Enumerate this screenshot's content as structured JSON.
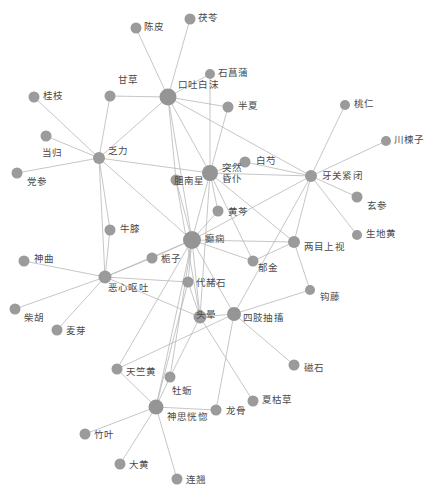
{
  "figure": {
    "type": "network-graph",
    "title": "",
    "node_color": "#9b9b9b",
    "edge_color": "#b8b8b8",
    "label_color": "#4a4a4a",
    "background": "#ffffff",
    "width": 434,
    "height": 499
  },
  "chart_data": {
    "type": "network",
    "title": "",
    "nodes": [
      {
        "id": "chenpi",
        "label": "陈皮",
        "x": 136,
        "y": 28,
        "r": 5.5,
        "lx": 144,
        "ly": 22
      },
      {
        "id": "fuling",
        "label": "茯苓",
        "x": 190,
        "y": 19,
        "r": 5.5,
        "lx": 198,
        "ly": 13
      },
      {
        "id": "shichangpu",
        "label": "石菖蒲",
        "x": 210,
        "y": 74,
        "r": 5.0,
        "lx": 218,
        "ly": 68
      },
      {
        "id": "gancao",
        "label": "甘草",
        "x": 110,
        "y": 96,
        "r": 5.5,
        "lx": 118,
        "ly": 75
      },
      {
        "id": "koutubaimo",
        "label": "口吐白沫",
        "x": 168,
        "y": 97,
        "r": 8.5,
        "lx": 178,
        "ly": 80
      },
      {
        "id": "banxia",
        "label": "半夏",
        "x": 228,
        "y": 107,
        "r": 5.5,
        "lx": 238,
        "ly": 101
      },
      {
        "id": "guizhi",
        "label": "桂枝",
        "x": 34,
        "y": 97,
        "r": 5.5,
        "lx": 43,
        "ly": 91
      },
      {
        "id": "taoren",
        "label": "桃仁",
        "x": 345,
        "y": 105,
        "r": 5.0,
        "lx": 354,
        "ly": 99
      },
      {
        "id": "danggui",
        "label": "当归",
        "x": 46,
        "y": 136,
        "r": 5.5,
        "lx": 42,
        "ly": 148
      },
      {
        "id": "fali",
        "label": "乏力",
        "x": 99,
        "y": 158,
        "r": 6.0,
        "lx": 108,
        "ly": 146
      },
      {
        "id": "chuanlianzi",
        "label": "川楝子",
        "x": 386,
        "y": 141,
        "r": 5.0,
        "lx": 394,
        "ly": 135
      },
      {
        "id": "baishao",
        "label": "白芍",
        "x": 245,
        "y": 162,
        "r": 5.5,
        "lx": 256,
        "ly": 156
      },
      {
        "id": "dangshen",
        "label": "党参",
        "x": 17,
        "y": 173,
        "r": 5.5,
        "lx": 27,
        "ly": 177
      },
      {
        "id": "yaguanjinbi",
        "label": "牙关紧闭",
        "x": 311,
        "y": 176,
        "r": 6.0,
        "lx": 322,
        "ly": 171
      },
      {
        "id": "dannanxing",
        "label": "胆南星",
        "x": 176,
        "y": 180,
        "r": 5.5,
        "lx": 174,
        "ly": 176
      },
      {
        "id": "turanhunpu",
        "label": "突然昏仆",
        "x": 210,
        "y": 173,
        "r": 8.0,
        "lx": 222,
        "ly": 163
      },
      {
        "id": "xuanshen",
        "label": "玄参",
        "x": 357,
        "y": 197,
        "r": 5.5,
        "lx": 367,
        "ly": 201
      },
      {
        "id": "niuxi",
        "label": "牛膝",
        "x": 110,
        "y": 230,
        "r": 5.5,
        "lx": 120,
        "ly": 224
      },
      {
        "id": "huangqin",
        "label": "黄芩",
        "x": 218,
        "y": 211,
        "r": 5.5,
        "lx": 228,
        "ly": 207
      },
      {
        "id": "shengdihuang",
        "label": "生地黄",
        "x": 357,
        "y": 235,
        "r": 5.0,
        "lx": 366,
        "ly": 229
      },
      {
        "id": "dianxian",
        "label": "癫痫",
        "x": 192,
        "y": 240,
        "r": 9.0,
        "lx": 205,
        "ly": 234
      },
      {
        "id": "liangmushang",
        "label": "两目上视",
        "x": 294,
        "y": 242,
        "r": 6.0,
        "lx": 304,
        "ly": 242
      },
      {
        "id": "zhizi",
        "label": "栀子",
        "x": 152,
        "y": 258,
        "r": 5.5,
        "lx": 161,
        "ly": 254
      },
      {
        "id": "shenqu",
        "label": "神曲",
        "x": 24,
        "y": 261,
        "r": 5.5,
        "lx": 34,
        "ly": 254
      },
      {
        "id": "yujin",
        "label": "郁金",
        "x": 253,
        "y": 261,
        "r": 5.5,
        "lx": 258,
        "ly": 263
      },
      {
        "id": "exinoutu",
        "label": "恶心呕吐",
        "x": 105,
        "y": 277,
        "r": 6.5,
        "lx": 108,
        "ly": 283
      },
      {
        "id": "daizheshi",
        "label": "代赭石",
        "x": 188,
        "y": 282,
        "r": 5.5,
        "lx": 196,
        "ly": 278
      },
      {
        "id": "gouteng",
        "label": "钩藤",
        "x": 310,
        "y": 290,
        "r": 5.0,
        "lx": 320,
        "ly": 292
      },
      {
        "id": "chaihu",
        "label": "柴胡",
        "x": 15,
        "y": 309,
        "r": 5.5,
        "lx": 24,
        "ly": 313
      },
      {
        "id": "touyun",
        "label": "头晕",
        "x": 200,
        "y": 317,
        "r": 6.5,
        "lx": 196,
        "ly": 310
      },
      {
        "id": "sizhichouchu",
        "label": "四肢抽搐",
        "x": 234,
        "y": 314,
        "r": 7.0,
        "lx": 243,
        "ly": 313
      },
      {
        "id": "maiya",
        "label": "麦芽",
        "x": 57,
        "y": 330,
        "r": 5.5,
        "lx": 66,
        "ly": 326
      },
      {
        "id": "cishi",
        "label": "磁石",
        "x": 294,
        "y": 365,
        "r": 5.5,
        "lx": 304,
        "ly": 363
      },
      {
        "id": "tianzhuhuang",
        "label": "天竺黄",
        "x": 117,
        "y": 369,
        "r": 5.5,
        "lx": 126,
        "ly": 367
      },
      {
        "id": "muli",
        "label": "牡蛎",
        "x": 170,
        "y": 377,
        "r": 5.5,
        "lx": 172,
        "ly": 386
      },
      {
        "id": "xiakucao",
        "label": "夏枯草",
        "x": 253,
        "y": 401,
        "r": 5.5,
        "lx": 262,
        "ly": 395
      },
      {
        "id": "shensihuang",
        "label": "神思恍惚",
        "x": 156,
        "y": 407,
        "r": 7.5,
        "lx": 167,
        "ly": 412
      },
      {
        "id": "longgu",
        "label": "龙骨",
        "x": 216,
        "y": 410,
        "r": 5.5,
        "lx": 226,
        "ly": 406
      },
      {
        "id": "zhuye",
        "label": "竹叶",
        "x": 85,
        "y": 434,
        "r": 5.5,
        "lx": 94,
        "ly": 430
      },
      {
        "id": "dahuang",
        "label": "大黄",
        "x": 120,
        "y": 464,
        "r": 5.5,
        "lx": 129,
        "ly": 460
      },
      {
        "id": "lianqiao",
        "label": "连翘",
        "x": 177,
        "y": 479,
        "r": 5.5,
        "lx": 186,
        "ly": 475
      }
    ],
    "edges": [
      [
        "chenpi",
        "koutubaimo"
      ],
      [
        "fuling",
        "koutubaimo"
      ],
      [
        "shichangpu",
        "koutubaimo"
      ],
      [
        "gancao",
        "koutubaimo"
      ],
      [
        "gancao",
        "fali"
      ],
      [
        "koutubaimo",
        "banxia"
      ],
      [
        "koutubaimo",
        "turanhunpu"
      ],
      [
        "koutubaimo",
        "dannanxing"
      ],
      [
        "koutubaimo",
        "dianxian"
      ],
      [
        "koutubaimo",
        "yaguanjinbi"
      ],
      [
        "koutubaimo",
        "fali"
      ],
      [
        "banxia",
        "turanhunpu"
      ],
      [
        "shichangpu",
        "turanhunpu"
      ],
      [
        "guizhi",
        "fali"
      ],
      [
        "danggui",
        "fali"
      ],
      [
        "dangshen",
        "fali"
      ],
      [
        "fali",
        "turanhunpu"
      ],
      [
        "fali",
        "niuxi"
      ],
      [
        "fali",
        "dianxian"
      ],
      [
        "fali",
        "exinoutu"
      ],
      [
        "taoren",
        "yaguanjinbi"
      ],
      [
        "chuanlianzi",
        "yaguanjinbi"
      ],
      [
        "yaguanjinbi",
        "xuanshen"
      ],
      [
        "yaguanjinbi",
        "shengdihuang"
      ],
      [
        "yaguanjinbi",
        "turanhunpu"
      ],
      [
        "yaguanjinbi",
        "dianxian"
      ],
      [
        "yaguanjinbi",
        "liangmushang"
      ],
      [
        "yaguanjinbi",
        "sizhichouchu"
      ],
      [
        "baishao",
        "turanhunpu"
      ],
      [
        "baishao",
        "yaguanjinbi"
      ],
      [
        "turanhunpu",
        "huangqin"
      ],
      [
        "turanhunpu",
        "dianxian"
      ],
      [
        "turanhunpu",
        "touyun"
      ],
      [
        "turanhunpu",
        "liangmushang"
      ],
      [
        "turanhunpu",
        "yujin"
      ],
      [
        "dannanxing",
        "dianxian"
      ],
      [
        "dannanxing",
        "touyun"
      ],
      [
        "huangqin",
        "dianxian"
      ],
      [
        "niuxi",
        "exinoutu"
      ],
      [
        "shenqu",
        "exinoutu"
      ],
      [
        "chaihu",
        "exinoutu"
      ],
      [
        "maiya",
        "exinoutu"
      ],
      [
        "exinoutu",
        "zhizi"
      ],
      [
        "exinoutu",
        "dianxian"
      ],
      [
        "exinoutu",
        "touyun"
      ],
      [
        "exinoutu",
        "daizheshi"
      ],
      [
        "zhizi",
        "dianxian"
      ],
      [
        "dianxian",
        "yujin"
      ],
      [
        "dianxian",
        "daizheshi"
      ],
      [
        "dianxian",
        "touyun"
      ],
      [
        "dianxian",
        "sizhichouchu"
      ],
      [
        "dianxian",
        "liangmushang"
      ],
      [
        "dianxian",
        "tianzhuhuang"
      ],
      [
        "dianxian",
        "muli"
      ],
      [
        "dianxian",
        "shensihuang"
      ],
      [
        "yujin",
        "liangmushang"
      ],
      [
        "liangmushang",
        "gouteng"
      ],
      [
        "gouteng",
        "sizhichouchu"
      ],
      [
        "daizheshi",
        "touyun"
      ],
      [
        "daizheshi",
        "shensihuang"
      ],
      [
        "touyun",
        "sizhichouchu"
      ],
      [
        "touyun",
        "muli"
      ],
      [
        "touyun",
        "xiakucao"
      ],
      [
        "sizhichouchu",
        "cishi"
      ],
      [
        "sizhichouchu",
        "longgu"
      ],
      [
        "sizhichouchu",
        "tianzhuhuang"
      ],
      [
        "tianzhuhuang",
        "shensihuang"
      ],
      [
        "muli",
        "shensihuang"
      ],
      [
        "shensihuang",
        "zhuye"
      ],
      [
        "shensihuang",
        "dahuang"
      ],
      [
        "shensihuang",
        "lianqiao"
      ],
      [
        "shensihuang",
        "longgu"
      ]
    ]
  }
}
